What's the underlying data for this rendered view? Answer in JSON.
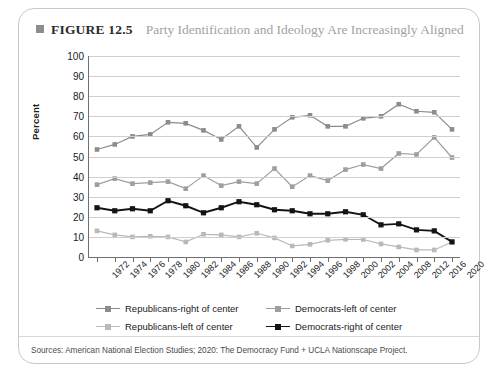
{
  "figure": {
    "marker_icon": "filled-square-icon",
    "label": "FIGURE 12.5",
    "title": "Party Identification and Ideology Are Increasingly Aligned"
  },
  "source": {
    "text": "Sources: American National Election Studies; 2020: The Democracy Fund + UCLA Nationscape Project."
  },
  "colors": {
    "republicans_right": "#8c8c8c",
    "democrats_left": "#9e9e9e",
    "democrats_right": "#141414",
    "republicans_left": "#b9b9b9",
    "gridline": "#cfcfcf",
    "axis": "#6f6f6f",
    "figure_label": "#2b2b2b",
    "figure_title": "#a2a2a2",
    "panel_border": "#c9c9c9"
  },
  "chart_data": {
    "type": "line",
    "title": "Party Identification and Ideology Are Increasingly Aligned",
    "xlabel": "",
    "ylabel": "Percent",
    "ylim": [
      0,
      100
    ],
    "ytick_step": 10,
    "yticks": [
      0,
      10,
      20,
      30,
      40,
      50,
      60,
      70,
      80,
      90,
      100
    ],
    "grid": true,
    "legend_position": "bottom",
    "categories": [
      "1972",
      "1974",
      "1976",
      "1978",
      "1980",
      "1982",
      "1984",
      "1986",
      "1988",
      "1990",
      "1992",
      "1994",
      "1996",
      "1998",
      "2000",
      "2002",
      "2004",
      "2008",
      "2012",
      "2016",
      "2020"
    ],
    "series": [
      {
        "name": "Republicans-right of center",
        "color": "#8c8c8c",
        "values": [
          53.5,
          56,
          60,
          61,
          67,
          66.5,
          63,
          58.5,
          65,
          54.5,
          63.5,
          69.5,
          70.5,
          65,
          65,
          69,
          70,
          76,
          72.5,
          72,
          63.5
        ]
      },
      {
        "name": "Democrats-left of center",
        "color": "#9e9e9e",
        "values": [
          36,
          39,
          36.5,
          37,
          37.5,
          34,
          40.5,
          35.5,
          37.5,
          36.5,
          44,
          35,
          40.5,
          38,
          43.5,
          46,
          44,
          51.5,
          51,
          59.5,
          49.5
        ]
      },
      {
        "name": "Democrats-right of center",
        "color": "#141414",
        "values": [
          24.5,
          23,
          24,
          23,
          28,
          25.5,
          22,
          24.5,
          27.5,
          26,
          23.5,
          23,
          21.5,
          21.5,
          22.5,
          21,
          16,
          16.5,
          13.5,
          13,
          7.5
        ]
      },
      {
        "name": "Republicans-left of center",
        "color": "#b9b9b9",
        "values": [
          13,
          11,
          10,
          10.3,
          10,
          7.5,
          11.3,
          11,
          10,
          11.8,
          9.5,
          5.5,
          6.3,
          8.3,
          8.8,
          8.7,
          6.5,
          5,
          3.5,
          3.5,
          7.5
        ]
      }
    ],
    "legend_entries": [
      "Republicans-right of center",
      "Democrats-left of center",
      "Republicans-left of center",
      "Democrats-right of center"
    ]
  }
}
